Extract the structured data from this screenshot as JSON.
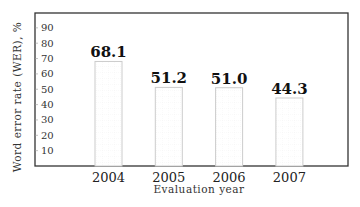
{
  "chart_data": {
    "type": "bar",
    "title": "",
    "xlabel": "Evaluation year",
    "ylabel": "Word error rate (WER), %",
    "categories": [
      "2004",
      "2005",
      "2006",
      "2007"
    ],
    "values": [
      68.1,
      51.2,
      51.0,
      44.3
    ],
    "data_labels": [
      "68.1",
      "51.2",
      "51.0",
      "44.3"
    ],
    "ylim": [
      0,
      100
    ],
    "yticks": [
      10,
      20,
      30,
      40,
      50,
      60,
      70,
      80,
      90
    ],
    "ytick_labels": [
      "10",
      "20",
      "30",
      "40",
      "50",
      "60",
      "70",
      "80",
      "90"
    ],
    "grid": false,
    "legend": "none",
    "colors": {
      "frame": "#333333",
      "bar_outline": "#cccccc",
      "bar_fill": "#ffffff",
      "bar_grid": "#eeeeee"
    }
  }
}
